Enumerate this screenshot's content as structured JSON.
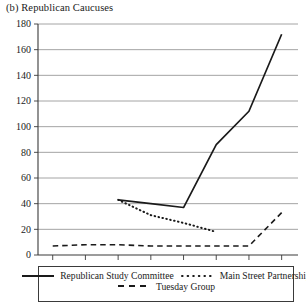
{
  "chart_data": {
    "type": "line",
    "title": "(b) Republican Caucuses",
    "xlabel": "",
    "ylabel": "",
    "xlim": [
      104.55,
      112.5
    ],
    "ylim": [
      0,
      180
    ],
    "ytick_step": 20,
    "grid": "horizontal",
    "legend_position": "below",
    "x": [
      105,
      106,
      107,
      108,
      109,
      110,
      111,
      112
    ],
    "xtick_labels": [
      "105",
      "106",
      "107",
      "108",
      "109",
      "110",
      "111",
      "112"
    ],
    "ytick_labels": [
      "0",
      "20",
      "40",
      "60",
      "80",
      "100",
      "120",
      "140",
      "160",
      "180"
    ],
    "series": [
      {
        "name": "Republican Study Committee",
        "style": "solid",
        "x": [
          107,
          108,
          109,
          110,
          111,
          112
        ],
        "values": [
          43,
          40,
          37,
          86,
          112,
          172
        ]
      },
      {
        "name": "Main Street Partnership",
        "style": "dotted",
        "x": [
          107,
          108,
          109,
          110
        ],
        "values": [
          43,
          31,
          25,
          18
        ]
      },
      {
        "name": "Tuesday Group",
        "style": "dashed",
        "x": [
          105,
          106,
          107,
          108,
          109,
          110,
          111,
          112
        ],
        "values": [
          7,
          8,
          8,
          7,
          7,
          7,
          7,
          33
        ]
      }
    ]
  },
  "legend": {
    "items": [
      {
        "label": "Republican Study Committee",
        "style": "solid"
      },
      {
        "label": "Main Street Partnership",
        "style": "dotted"
      },
      {
        "label": "Tuesday Group",
        "style": "dashed"
      }
    ]
  },
  "colors": {
    "line": "#1a1a1a",
    "grid": "#9a9a9a",
    "axis": "#3a3a3a",
    "text": "#1a1a1a"
  }
}
